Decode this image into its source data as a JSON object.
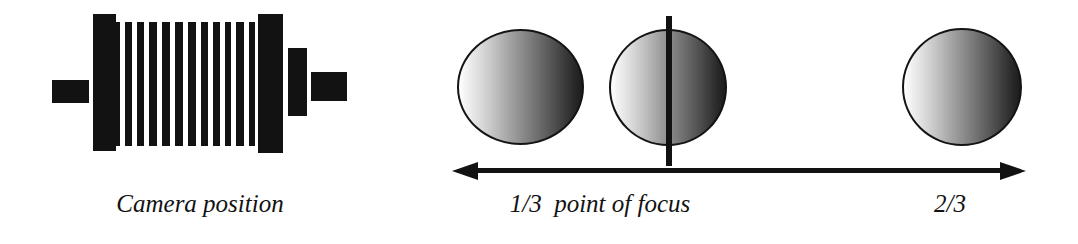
{
  "figure": {
    "background_color": "#ffffff",
    "ink_color": "#121212"
  },
  "camera": {
    "label": "Camera position",
    "parts": {
      "front_tab": "lens-board-tab",
      "front_plate": "front-standard",
      "bellows": "bellows",
      "rear_plate": "rear-standard",
      "rear_block": "film-back",
      "rear_tab": "rear-tab"
    },
    "bellows_slat_count": 12
  },
  "focus_scene": {
    "spheres": [
      {
        "name": "sphere-near",
        "position_label": "1/3"
      },
      {
        "name": "sphere-focus",
        "position_label": "point of focus"
      },
      {
        "name": "sphere-far",
        "position_label": "2/3"
      }
    ],
    "focus_plane": "focus-plane",
    "axis": {
      "left_arrow": true,
      "right_arrow": true
    },
    "labels": {
      "left": "1/3  point of focus",
      "right": "2/3"
    }
  }
}
